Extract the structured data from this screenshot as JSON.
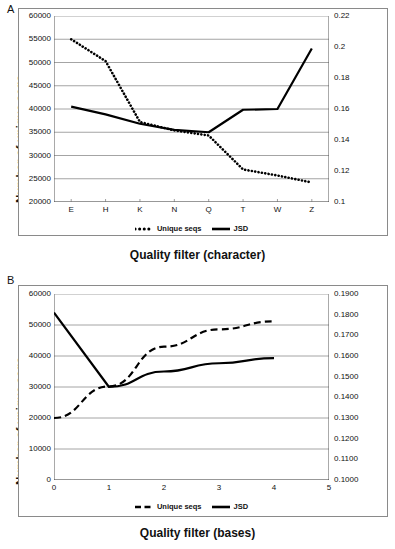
{
  "figure": {
    "panels": [
      {
        "letter": "A",
        "xlabel": "Quality filter (character)",
        "ylabel_left": "Number of unique seqs",
        "ylabel_right": "Distance from mock (JSD)",
        "legend": [
          {
            "label": "Unique seqs",
            "style": "dotted"
          },
          {
            "label": "JSD",
            "style": "solid"
          }
        ]
      },
      {
        "letter": "B",
        "xlabel": "Quality filter (bases)",
        "ylabel_left": "Number of unique seqs",
        "ylabel_right": "Distance from mock (JSD)",
        "legend": [
          {
            "label": "Unique seqs",
            "style": "dashed"
          },
          {
            "label": "JSD",
            "style": "solid"
          }
        ]
      }
    ]
  },
  "chart_data": [
    {
      "type": "line",
      "title": "A",
      "xlabel": "Quality filter (character)",
      "ylabel": "Number of unique seqs",
      "y2label": "Distance from mock (JSD)",
      "categories": [
        "E",
        "H",
        "K",
        "N",
        "Q",
        "T",
        "W",
        "Z"
      ],
      "xtick_labels": [
        "E",
        "H",
        "K",
        "N",
        "Q",
        "T",
        "W",
        "Z"
      ],
      "ylim": [
        20000,
        60000
      ],
      "ytick_labels": [
        "20000",
        "25000",
        "30000",
        "35000",
        "40000",
        "45000",
        "50000",
        "55000",
        "60000"
      ],
      "ytick_values": [
        20000,
        25000,
        30000,
        35000,
        40000,
        45000,
        50000,
        55000,
        60000
      ],
      "y2lim": [
        0.1,
        0.22
      ],
      "y2tick_labels": [
        "0.1",
        "0.12",
        "0.14",
        "0.16",
        "0.18",
        "0.2",
        "0.22"
      ],
      "y2tick_values": [
        0.1,
        0.12,
        0.14,
        0.16,
        0.18,
        0.2,
        0.22
      ],
      "grid": true,
      "legend_position": "bottom",
      "series": [
        {
          "name": "Unique seqs",
          "axis": "left",
          "style": "dotted",
          "values": [
            55000,
            50300,
            37200,
            35400,
            34300,
            27000,
            25700,
            24200
          ]
        },
        {
          "name": "JSD",
          "axis": "right",
          "style": "solid",
          "values": [
            0.1615,
            0.1565,
            0.1505,
            0.1465,
            0.145,
            0.1595,
            0.16,
            0.199
          ]
        }
      ]
    },
    {
      "type": "line",
      "title": "B",
      "xlabel": "Quality filter (bases)",
      "ylabel": "Number of unique seqs",
      "y2label": "Distance from mock (JSD)",
      "x": [
        0,
        1,
        2,
        3,
        4
      ],
      "xlim": [
        0,
        5
      ],
      "xtick_labels": [
        "0",
        "1",
        "2",
        "3",
        "4",
        "5"
      ],
      "xtick_values": [
        0,
        1,
        2,
        3,
        4,
        5
      ],
      "ylim": [
        0,
        60000
      ],
      "ytick_labels": [
        "0",
        "10000",
        "20000",
        "30000",
        "40000",
        "50000",
        "60000"
      ],
      "ytick_values": [
        0,
        10000,
        20000,
        30000,
        40000,
        50000,
        60000
      ],
      "y2lim": [
        0.1,
        0.19
      ],
      "y2tick_labels": [
        "0.1000",
        "0.1100",
        "0.1200",
        "0.1300",
        "0.1400",
        "0.1500",
        "0.1600",
        "0.1700",
        "0.1800",
        "0.1900"
      ],
      "y2tick_values": [
        0.1,
        0.11,
        0.12,
        0.13,
        0.14,
        0.15,
        0.16,
        0.17,
        0.18,
        0.19
      ],
      "grid": true,
      "legend_position": "bottom",
      "series": [
        {
          "name": "Unique seqs",
          "axis": "left",
          "style": "dashed",
          "values": [
            20000,
            30200,
            43000,
            48600,
            51200
          ]
        },
        {
          "name": "JSD",
          "axis": "right",
          "style": "solid",
          "values": [
            0.181,
            0.145,
            0.1525,
            0.1565,
            0.159
          ]
        }
      ]
    }
  ]
}
